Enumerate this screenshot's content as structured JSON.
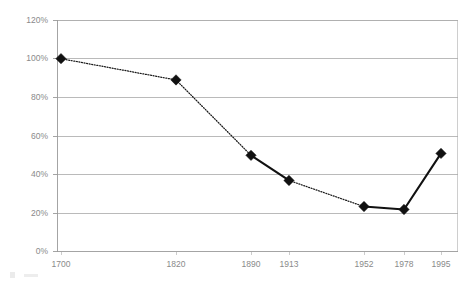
{
  "chart_data": {
    "type": "line",
    "title": "",
    "subtitle": "",
    "xlabel": "",
    "ylabel": "",
    "categories": [
      "1700",
      "1820",
      "1890",
      "1913",
      "1952",
      "1978",
      "1995"
    ],
    "x": [
      1700,
      1820,
      1890,
      1913,
      1952,
      1978,
      1995
    ],
    "values": [
      100,
      89,
      50,
      37,
      23.5,
      22,
      51
    ],
    "value_labels": [
      "100%",
      "89%",
      "50%",
      "37%",
      "23.5%",
      "22%",
      "51%"
    ],
    "series": [
      {
        "name": "",
        "values": [
          100,
          89,
          50,
          37,
          23.5,
          22,
          51
        ]
      }
    ],
    "ylim": [
      0,
      120
    ],
    "ytick_values": [
      0,
      20,
      40,
      60,
      80,
      100,
      120
    ],
    "ytick_labels": [
      "0%",
      "20%",
      "40%",
      "60%",
      "80%",
      "100%",
      "120%"
    ],
    "xtick_labels": [
      "1700",
      "1820",
      "1890",
      "1913",
      "1952",
      "1978",
      "1995"
    ],
    "grid": "horizontal",
    "legend": "none",
    "marker": "diamond",
    "segment_styles": [
      "dotted",
      "dotted",
      "solid",
      "dotted",
      "solid",
      "solid"
    ],
    "colors": {
      "line": "#111111",
      "marker": "#111111",
      "gridline": "#a9a9a9",
      "axis_text": "#8a8a8a",
      "background": "#ffffff",
      "frame": "#c2c2c2"
    },
    "annotations": []
  },
  "axes": {
    "y_labels": [
      "120%",
      "100%",
      "80%",
      "60%",
      "40%",
      "20%",
      "0%"
    ],
    "x_labels": [
      "1700",
      "1820",
      "1890",
      "1913",
      "1952",
      "1978",
      "1995"
    ]
  }
}
